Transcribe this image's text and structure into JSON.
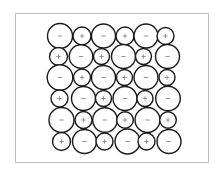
{
  "diagram": {
    "title": "",
    "frame": {
      "x": 15,
      "y": 13,
      "width": 194,
      "height": 150,
      "color": "#bdbdbd"
    },
    "colors": {
      "outline": "#1a1a1a",
      "sign": "#8a8a8a",
      "fill": "#ffffff"
    },
    "legend": {
      "anion_symbol": "−",
      "cation_symbol": "+"
    },
    "rows": [
      {
        "y": 36,
        "ions": [
          {
            "x": 60,
            "r": 12.5,
            "charge": "-"
          },
          {
            "x": 82,
            "r": 9,
            "charge": "+"
          },
          {
            "x": 103.5,
            "r": 12,
            "charge": "-"
          },
          {
            "x": 125,
            "r": 9,
            "charge": "+"
          },
          {
            "x": 146,
            "r": 12,
            "charge": "-"
          },
          {
            "x": 165.5,
            "r": 8.5,
            "charge": "+"
          }
        ]
      },
      {
        "y": 56.5,
        "ions": [
          {
            "x": 58.5,
            "r": 9,
            "charge": "+"
          },
          {
            "x": 81,
            "r": 11.8,
            "charge": "-"
          },
          {
            "x": 101.5,
            "r": 8,
            "charge": "+"
          },
          {
            "x": 123.5,
            "r": 12,
            "charge": "-"
          },
          {
            "x": 143.5,
            "r": 8,
            "charge": "+"
          },
          {
            "x": 167.5,
            "r": 12,
            "charge": "-"
          }
        ]
      },
      {
        "y": 77.5,
        "ions": [
          {
            "x": 60,
            "r": 12.8,
            "charge": "-"
          },
          {
            "x": 82,
            "r": 8.5,
            "charge": "+"
          },
          {
            "x": 103.5,
            "r": 12,
            "charge": "-"
          },
          {
            "x": 124.5,
            "r": 8,
            "charge": "+"
          },
          {
            "x": 146,
            "r": 12,
            "charge": "-"
          },
          {
            "x": 167,
            "r": 8,
            "charge": "+"
          }
        ]
      },
      {
        "y": 98.5,
        "ions": [
          {
            "x": 59.5,
            "r": 8.5,
            "charge": "+"
          },
          {
            "x": 83.5,
            "r": 12,
            "charge": "-"
          },
          {
            "x": 103.5,
            "r": 8,
            "charge": "+"
          },
          {
            "x": 125,
            "r": 12,
            "charge": "-"
          },
          {
            "x": 145,
            "r": 8,
            "charge": "+"
          },
          {
            "x": 168,
            "r": 12.3,
            "charge": "-"
          }
        ]
      },
      {
        "y": 120,
        "ions": [
          {
            "x": 61.5,
            "r": 12.5,
            "charge": "-"
          },
          {
            "x": 83.5,
            "r": 8.5,
            "charge": "+"
          },
          {
            "x": 105,
            "r": 12.3,
            "charge": "-"
          },
          {
            "x": 125,
            "r": 8.3,
            "charge": "+"
          },
          {
            "x": 147.5,
            "r": 12.5,
            "charge": "-"
          },
          {
            "x": 168,
            "r": 8.3,
            "charge": "+"
          }
        ]
      },
      {
        "y": 141.5,
        "ions": [
          {
            "x": 61.5,
            "r": 9,
            "charge": "+"
          },
          {
            "x": 84.5,
            "r": 12,
            "charge": "-"
          },
          {
            "x": 104.5,
            "r": 8.5,
            "charge": "+"
          },
          {
            "x": 127.5,
            "r": 12.5,
            "charge": "-"
          },
          {
            "x": 146.5,
            "r": 8.5,
            "charge": "+"
          },
          {
            "x": 169,
            "r": 12,
            "charge": "-"
          }
        ]
      }
    ]
  }
}
